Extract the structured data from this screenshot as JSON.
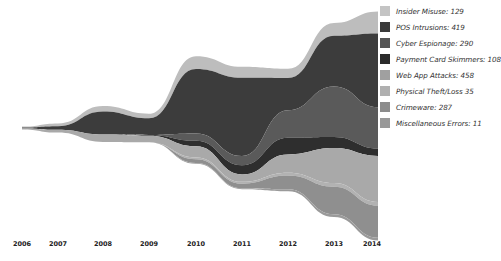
{
  "chart_data": {
    "type": "area",
    "subtype": "streamgraph",
    "title": "",
    "xlabel": "",
    "ylabel": "",
    "categories": [
      "2006",
      "2007",
      "2008",
      "2009",
      "2010",
      "2011",
      "2012",
      "2013",
      "2014"
    ],
    "legend_position": "right",
    "grid": false,
    "series": [
      {
        "name": "Insider Misuse",
        "total": 129,
        "color": "#bdbdbd",
        "values": [
          1,
          3,
          6,
          5,
          14,
          12,
          10,
          14,
          24
        ]
      },
      {
        "name": "POS Intrusions",
        "total": 419,
        "color": "#3c3c3c",
        "values": [
          1,
          4,
          25,
          18,
          70,
          85,
          35,
          55,
          80
        ]
      },
      {
        "name": "Cyber Espionage",
        "total": 290,
        "color": "#5a5a5a",
        "values": [
          0,
          0,
          0,
          0,
          8,
          10,
          30,
          55,
          45
        ]
      },
      {
        "name": "Payment Card Skimmers",
        "total": 108,
        "color": "#2e2e2e",
        "values": [
          0,
          0,
          0,
          1,
          6,
          10,
          18,
          12,
          8
        ]
      },
      {
        "name": "Web App Attacks",
        "total": 458,
        "color": "#a9a9a9",
        "values": [
          1,
          3,
          8,
          7,
          12,
          8,
          20,
          38,
          50
        ]
      },
      {
        "name": "Physical Theft/Loss",
        "total": 35,
        "color": "#b2b2b2",
        "values": [
          0,
          0,
          0,
          0,
          2,
          2,
          3,
          4,
          4
        ]
      },
      {
        "name": "Crimeware",
        "total": 287,
        "color": "#8f8f8f",
        "values": [
          0,
          0,
          0,
          0,
          4,
          5,
          15,
          30,
          35
        ]
      },
      {
        "name": "Miscellaneous Errors",
        "total": 11,
        "color": "#9a9a9a",
        "values": [
          0,
          0,
          0,
          0,
          1,
          1,
          2,
          3,
          3
        ]
      }
    ]
  },
  "legend": {
    "items": [
      {
        "label": "Insider Misuse: 129",
        "color": "#c4c4c4"
      },
      {
        "label": "POS Intrusions: 419",
        "color": "#3a3a3a"
      },
      {
        "label": "Cyber Espionage: 290",
        "color": "#555555"
      },
      {
        "label": "Payment Card Skimmers: 108",
        "color": "#2b2b2b"
      },
      {
        "label": "Web App Attacks: 458",
        "color": "#a0a0a0"
      },
      {
        "label": "Physical Theft/Loss 35",
        "color": "#b0b0b0"
      },
      {
        "label": "Crimeware: 287",
        "color": "#8c8c8c"
      },
      {
        "label": "Miscellaneous Errors: 11",
        "color": "#999999"
      }
    ]
  },
  "xaxis": {
    "ticks": [
      {
        "label": "2006",
        "x": 22
      },
      {
        "label": "2007",
        "x": 58
      },
      {
        "label": "2008",
        "x": 103
      },
      {
        "label": "2009",
        "x": 149
      },
      {
        "label": "2010",
        "x": 196
      },
      {
        "label": "2011",
        "x": 242
      },
      {
        "label": "2012",
        "x": 288
      },
      {
        "label": "2013",
        "x": 334
      },
      {
        "label": "2014",
        "x": 372
      }
    ]
  }
}
